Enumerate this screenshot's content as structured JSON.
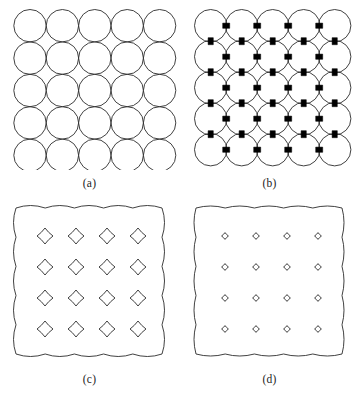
{
  "figure": {
    "type": "scientific-figure",
    "layout": "2x2-panel-grid",
    "background_color": "#ffffff",
    "stroke_color": "#2b2b2b",
    "neck_color": "#000000",
    "panels": [
      {
        "id": "a",
        "caption": "(a)",
        "description": "square array of tangent circles",
        "grid_rows": 5,
        "grid_cols": 5,
        "circle_radius": 16.2,
        "spacing": 32.4,
        "origin_x": 13.8,
        "origin_y": 9.5,
        "stroke_width": 0.9,
        "neck_half_width": 0,
        "fill": "none"
      },
      {
        "id": "b",
        "caption": "(b)",
        "description": "array of circles joined by thick dark necks with small diamond voids",
        "grid_rows": 5,
        "grid_cols": 5,
        "circle_radius": 16.2,
        "spacing": 31.0,
        "origin_x": 14.5,
        "origin_y": 9.5,
        "stroke_width": 0.9,
        "neck_half_width": 2.6,
        "neck_length": 7.0,
        "fill": "none"
      },
      {
        "id": "c",
        "caption": "(c)",
        "description": "scalloped outer boundary enclosing 4x4 array of concave diamond voids",
        "boundary": {
          "scallops_per_side": 5,
          "left": 16,
          "top": 12,
          "width": 146,
          "height": 146,
          "amplitude": 5.0
        },
        "void_rows": 4,
        "void_cols": 4,
        "void_size": 8.0,
        "void_spacing_x": 31.0,
        "void_spacing_y": 31.0,
        "void_origin_x": 45.0,
        "void_origin_y": 40.0,
        "stroke_width": 0.9
      },
      {
        "id": "d",
        "caption": "(d)",
        "description": "scalloped outer boundary enclosing 4x4 array of very small residual voids",
        "boundary": {
          "scallops_per_side": 5,
          "left": 16,
          "top": 12,
          "width": 146,
          "height": 146,
          "amplitude": 4.0
        },
        "void_rows": 4,
        "void_cols": 4,
        "void_size": 3.4,
        "void_spacing_x": 31.0,
        "void_spacing_y": 31.0,
        "void_origin_x": 45.0,
        "void_origin_y": 40.0,
        "stroke_width": 0.9
      }
    ]
  }
}
